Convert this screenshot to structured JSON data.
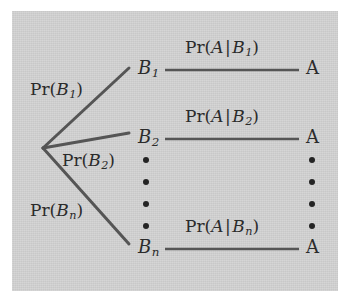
{
  "figure": {
    "type": "probability-tree-diagram",
    "panel_color": "#d3d3d3",
    "line_color": "#555555",
    "text_color": "#2b2b2b",
    "background_color": "#ffffff"
  },
  "branch_labels": [
    {
      "prefix": "Pr(",
      "variable": "B",
      "subscript": "1",
      "suffix": ")",
      "full": "Pr(B1)"
    },
    {
      "prefix": "Pr(",
      "variable": "B",
      "subscript": "2",
      "suffix": ")",
      "full": "Pr(B2)"
    },
    {
      "prefix": "Pr(",
      "variable": "B",
      "subscript": "n",
      "suffix": ")",
      "full": "Pr(Bn)"
    }
  ],
  "b_nodes": [
    {
      "variable": "B",
      "subscript": "1"
    },
    {
      "variable": "B",
      "subscript": "2"
    },
    {
      "variable": "B",
      "subscript": "n"
    }
  ],
  "conditional_labels": [
    {
      "prefix": "Pr(",
      "event": "A",
      "bar": "|",
      "variable": "B",
      "subscript": "1",
      "suffix": ")",
      "full": "Pr(A | B1)"
    },
    {
      "prefix": "Pr(",
      "event": "A",
      "bar": "|",
      "variable": "B",
      "subscript": "2",
      "suffix": ")",
      "full": "Pr(A | B2)"
    },
    {
      "prefix": "Pr(",
      "event": "A",
      "bar": "|",
      "variable": "B",
      "subscript": "n",
      "suffix": ")",
      "full": "Pr(A | Bn)"
    }
  ],
  "a_nodes": [
    {
      "label": "A"
    },
    {
      "label": "A"
    },
    {
      "label": "A"
    }
  ],
  "ellipsis": {
    "dot_count": 4,
    "columns": [
      "left-b-column",
      "right-a-column"
    ]
  }
}
